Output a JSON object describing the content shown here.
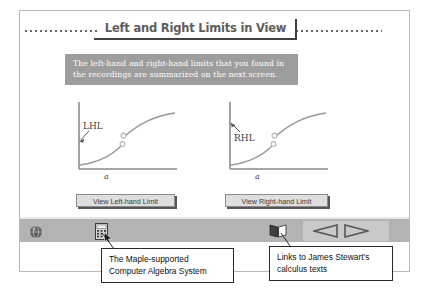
{
  "header": {
    "title": "Left and Right Limits in View"
  },
  "message": {
    "line1": "The left-hand and right-hand limits that you found in",
    "line2": "the recordings are summarized on the next screen."
  },
  "graphs": [
    {
      "id": "left-hand-limit-graph",
      "annotation": "LHL",
      "axis_label": "a",
      "button_label": "View Left-hand Limit"
    },
    {
      "id": "right-hand-limit-graph",
      "annotation": "RHL",
      "axis_label": "a",
      "button_label": "View Right-hand Limit"
    }
  ],
  "toolbar": {
    "globe_icon": "globe-icon",
    "calculator_icon": "calculator-icon",
    "book_icon": "book-icon",
    "prev_icon": "previous-arrow-icon",
    "next_icon": "next-arrow-icon",
    "cursor_icon": "mouse-cursor-icon"
  },
  "callouts": {
    "left": {
      "line1": "The Maple-supported",
      "line2": "Computer Algebra System"
    },
    "right": {
      "line1": "Links to James Stewart's",
      "line2": "calculus texts"
    }
  },
  "colors": {
    "banner_background": "#9d9d9d",
    "toolbar_background": "#b3b3b3",
    "button_face": "#dedede",
    "title_text": "#5d5d5d",
    "frame_border": "#b9b9b9"
  }
}
